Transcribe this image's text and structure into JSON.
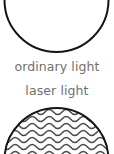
{
  "figure": {
    "background_color": "#ffffff",
    "width": 114,
    "height": 154
  },
  "panels": [
    {
      "id": "ordinary-light",
      "caption": "ordinary light",
      "circle_outline_color": "#141414",
      "wave_color": "#b3b3b3",
      "wave_description": "incoherent, irregular, unaligned wavy lines",
      "wave_rows": 4,
      "wave_amplitude": 3.2,
      "wave_wavelength": 18,
      "coherent": "no"
    },
    {
      "id": "laser-light",
      "caption": "laser light",
      "circle_outline_color": "#141414",
      "wave_color": "#4a4a4a",
      "wave_description": "coherent, evenly spaced, in-phase parallel wavy lines",
      "wave_rows": 7,
      "wave_amplitude": 3.0,
      "wave_wavelength": 17,
      "coherent": "yes"
    }
  ],
  "captions": {
    "ordinary": "ordinary light",
    "laser": "laser light",
    "text_color": "#6f6f6f"
  }
}
